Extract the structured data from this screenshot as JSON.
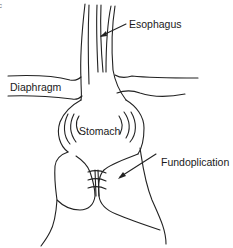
{
  "figure": {
    "panel_mark": "c",
    "labels": {
      "esophagus": "Esophagus",
      "diaphragm": "Diaphragm",
      "stomach": "Stomach",
      "fundoplication": "Fundoplication"
    },
    "colors": {
      "line": "#222222",
      "text": "#1a1a1a",
      "background": "#ffffff"
    }
  }
}
